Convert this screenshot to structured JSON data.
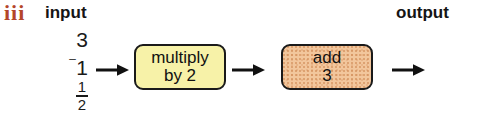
{
  "figure": {
    "marker": "iii",
    "marker_color": "#b4462a",
    "headers": {
      "input": "input",
      "output": "output"
    },
    "inputs": [
      {
        "display": "3",
        "type": "integer",
        "value": 3
      },
      {
        "display": "-1",
        "type": "negative-integer",
        "value": -1,
        "negative_sign": "⁻",
        "magnitude": "1"
      },
      {
        "display": "1/2",
        "type": "fraction",
        "numerator": "1",
        "denominator": "2",
        "value": 0.5
      }
    ],
    "operations": [
      {
        "id": "multiply",
        "line1": "multiply",
        "line2": "by 2",
        "fill_color": "#f7f2a8",
        "border_color": "#1a1a1a"
      },
      {
        "id": "add",
        "line1": "add",
        "line2": "3",
        "fill_color": "#f2c69c",
        "border_color": "#1a1a1a"
      }
    ],
    "arrows": [
      {
        "id": "arrow-input-to-multiply",
        "direction": "right"
      },
      {
        "id": "arrow-multiply-to-add",
        "direction": "right"
      },
      {
        "id": "arrow-add-to-output",
        "direction": "right"
      }
    ]
  }
}
